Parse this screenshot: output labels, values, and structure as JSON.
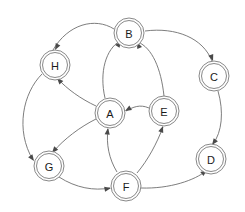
{
  "diagram": {
    "type": "directed-graph",
    "background_color": "#ffffff",
    "node_stroke_color": "#7a7a7a",
    "node_fill_color": "#ffffff",
    "edge_color": "#6e6e6e",
    "arrow_color": "#4a4a4a",
    "node_shape": "double-circle",
    "node_radius_outer": 15,
    "node_radius_inner": 12.5,
    "nodes": [
      {
        "id": "A",
        "label": "A",
        "cx": 110,
        "cy": 113,
        "shape": "double-circle"
      },
      {
        "id": "B",
        "label": "B",
        "cx": 129,
        "cy": 33,
        "shape": "double-circle"
      },
      {
        "id": "C",
        "label": "C",
        "cx": 214,
        "cy": 76,
        "shape": "double-circle"
      },
      {
        "id": "D",
        "label": "D",
        "cx": 211,
        "cy": 159,
        "shape": "double-circle"
      },
      {
        "id": "E",
        "label": "E",
        "cx": 164,
        "cy": 111,
        "shape": "double-circle"
      },
      {
        "id": "F",
        "label": "F",
        "cx": 126,
        "cy": 186,
        "shape": "double-circle"
      },
      {
        "id": "G",
        "label": "G",
        "cx": 49,
        "cy": 166,
        "shape": "double-circle"
      },
      {
        "id": "H",
        "label": "H",
        "cx": 55,
        "cy": 65,
        "shape": "double-circle"
      }
    ],
    "edges": [
      {
        "id": "e1",
        "from": "B",
        "to": "H",
        "path": "M 114 29 C 95 17 68 24 53 50",
        "arrow_at": [
          55,
          50
        ],
        "arrow_angle": 118
      },
      {
        "id": "e2",
        "from": "B",
        "to": "C",
        "path": "M 145 31 C 176 27 203 38 212 61",
        "arrow_at": [
          213,
          61
        ],
        "arrow_angle": 70
      },
      {
        "id": "e3",
        "from": "A",
        "to": "B",
        "path": "M 105 98 C 99 72 106 49 120 41",
        "arrow_at": [
          121,
          41
        ],
        "arrow_angle": -56
      },
      {
        "id": "e4",
        "from": "E",
        "to": "B",
        "path": "M 164 96 C 161 68 152 48 138 42",
        "arrow_at": [
          137,
          42
        ],
        "arrow_angle": -114
      },
      {
        "id": "e5",
        "from": "E",
        "to": "A",
        "path": "M 149 108 C 140 104 133 107 126 111",
        "arrow_at": [
          125,
          111
        ],
        "arrow_angle": 150
      },
      {
        "id": "e6",
        "from": "C",
        "to": "D",
        "path": "M 218 91 C 224 112 222 132 213 144",
        "arrow_at": [
          212,
          145
        ],
        "arrow_angle": 126
      },
      {
        "id": "e7",
        "from": "F",
        "to": "D",
        "path": "M 141 188 C 170 189 195 180 206 171",
        "arrow_at": [
          207,
          170
        ],
        "arrow_angle": -38
      },
      {
        "id": "e8",
        "from": "F",
        "to": "A",
        "path": "M 117 172 C 109 159 106 144 108 129",
        "arrow_at": [
          108,
          128
        ],
        "arrow_angle": -83
      },
      {
        "id": "e9",
        "from": "F",
        "to": "E",
        "path": "M 137 173 C 148 160 157 143 163 127",
        "arrow_at": [
          163,
          126
        ],
        "arrow_angle": -70
      },
      {
        "id": "e10",
        "from": "A",
        "to": "H",
        "path": "M 96 106 C 81 99 67 89 58 79",
        "arrow_at": [
          57,
          78
        ],
        "arrow_angle": -132
      },
      {
        "id": "e11",
        "from": "A",
        "to": "G",
        "path": "M 96 119 C 80 127 64 139 53 152",
        "arrow_at": [
          52,
          153
        ],
        "arrow_angle": 130
      },
      {
        "id": "e12",
        "from": "H",
        "to": "G",
        "path": "M 42 74 C 23 93 15 130 33 160",
        "arrow_at": [
          34,
          161
        ],
        "arrow_angle": 55
      },
      {
        "id": "e13",
        "from": "G",
        "to": "F",
        "path": "M 59 177 C 76 188 94 191 110 188",
        "arrow_at": [
          111,
          188
        ],
        "arrow_angle": -11
      }
    ]
  }
}
